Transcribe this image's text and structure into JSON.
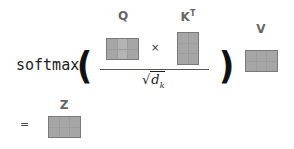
{
  "formula": {
    "function_name": "softmax",
    "left_paren": "(",
    "right_paren": ")",
    "multiply_symbol": "×",
    "equals_symbol": "=",
    "sqrt_symbol": "√",
    "denominator_var": "d",
    "denominator_sub": "k"
  },
  "matrices": {
    "q": {
      "label": "Q",
      "rows": 2,
      "cols": 3
    },
    "kt": {
      "label": "K",
      "superscript": "T",
      "rows": 3,
      "cols": 2
    },
    "v": {
      "label": "V",
      "rows": 2,
      "cols": 3
    },
    "z": {
      "label": "Z",
      "rows": 2,
      "cols": 3
    }
  },
  "colors": {
    "matrix_fill": "#a6a6a6",
    "matrix_border": "#7a7a7a",
    "label": "#666666"
  }
}
